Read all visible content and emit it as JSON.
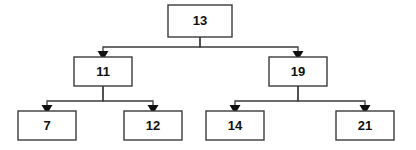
{
  "diagram": {
    "type": "binary-tree",
    "background_color": "#ffffff",
    "node_fill_color": "#ffffff",
    "node_border_color": "#3b3b3b",
    "edge_color": "#3b3b3b",
    "arrow_color": "#111111",
    "text_color": "#111111",
    "levels": 3,
    "edge_style": "orthogonal-elbow-with-arrowhead",
    "nodes": [
      {
        "id": "root",
        "label": "13",
        "level": 0,
        "x": 168,
        "y": 5,
        "width": 64,
        "height": 32,
        "cx": 200,
        "cy": 21
      },
      {
        "id": "left",
        "label": "11",
        "level": 1,
        "x": 74,
        "y": 57,
        "width": 58,
        "height": 29,
        "cx": 103,
        "cy": 71.5
      },
      {
        "id": "right",
        "label": "19",
        "level": 1,
        "x": 269,
        "y": 57,
        "width": 58,
        "height": 29,
        "cx": 298,
        "cy": 71.5
      },
      {
        "id": "left-left",
        "label": "7",
        "level": 2,
        "x": 18,
        "y": 111,
        "width": 58,
        "height": 29,
        "cx": 47,
        "cy": 125.5
      },
      {
        "id": "left-right",
        "label": "12",
        "level": 2,
        "x": 124,
        "y": 111,
        "width": 58,
        "height": 29,
        "cx": 153,
        "cy": 125.5
      },
      {
        "id": "right-left",
        "label": "14",
        "level": 2,
        "x": 206,
        "y": 111,
        "width": 58,
        "height": 29,
        "cx": 235,
        "cy": 125.5
      },
      {
        "id": "right-right",
        "label": "21",
        "level": 2,
        "x": 336,
        "y": 111,
        "width": 58,
        "height": 29,
        "cx": 365,
        "cy": 125.5
      }
    ],
    "edges": [
      {
        "id": "edge-root-left",
        "from": "root",
        "to": "left",
        "bus_y": 47,
        "from_x": 200,
        "to_x": 103
      },
      {
        "id": "edge-root-right",
        "from": "root",
        "to": "right",
        "bus_y": 47,
        "from_x": 200,
        "to_x": 298
      },
      {
        "id": "edge-left-leftleft",
        "from": "left",
        "to": "left-left",
        "bus_y": 101,
        "from_x": 103,
        "to_x": 47
      },
      {
        "id": "edge-left-leftright",
        "from": "left",
        "to": "left-right",
        "bus_y": 101,
        "from_x": 103,
        "to_x": 153
      },
      {
        "id": "edge-right-rightleft",
        "from": "right",
        "to": "right-left",
        "bus_y": 101,
        "from_x": 298,
        "to_x": 235
      },
      {
        "id": "edge-right-rightright",
        "from": "right",
        "to": "right-right",
        "bus_y": 101,
        "from_x": 298,
        "to_x": 365
      }
    ]
  }
}
